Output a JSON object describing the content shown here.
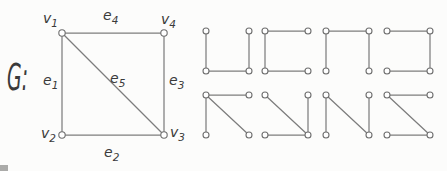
{
  "figure": {
    "width": 447,
    "height": 171,
    "background": "#fcfcfb",
    "line_color": "#7d7d7d",
    "text_color": "#3a3a3a",
    "vertex_fill": "#ffffff",
    "vertex_stroke": "#6f6f6f",
    "main_vertex_radius": 3.2,
    "small_vertex_radius": 3,
    "line_width": 1.25
  },
  "main_graph": {
    "name_label": "G:",
    "name_x": 7,
    "name_y": 90,
    "name_size": 38,
    "name_text_length": 21,
    "label_size": 14,
    "vertices": [
      {
        "id": "v1",
        "x": 62,
        "y": 33,
        "label": "v",
        "sub": "1",
        "lx": 43,
        "ly": 23
      },
      {
        "id": "v2",
        "x": 62,
        "y": 135,
        "label": "v",
        "sub": "2",
        "lx": 41,
        "ly": 138
      },
      {
        "id": "v3",
        "x": 164,
        "y": 135,
        "label": "v",
        "sub": "3",
        "lx": 170,
        "ly": 137
      },
      {
        "id": "v4",
        "x": 164,
        "y": 33,
        "label": "v",
        "sub": "4",
        "lx": 161,
        "ly": 24
      }
    ],
    "edges": [
      {
        "id": "e1",
        "from": "v1",
        "to": "v2",
        "label": "e",
        "sub": "1",
        "lx": 43,
        "ly": 85
      },
      {
        "id": "e2",
        "from": "v2",
        "to": "v3",
        "label": "e",
        "sub": "2",
        "lx": 104,
        "ly": 157
      },
      {
        "id": "e3",
        "from": "v4",
        "to": "v3",
        "label": "e",
        "sub": "3",
        "lx": 169,
        "ly": 85
      },
      {
        "id": "e4",
        "from": "v1",
        "to": "v4",
        "label": "e",
        "sub": "4",
        "lx": 103,
        "ly": 20
      },
      {
        "id": "e5",
        "from": "v1",
        "to": "v3",
        "label": "e",
        "sub": "5",
        "lx": 110,
        "ly": 83
      }
    ]
  },
  "subgraphs": {
    "columns_x": [
      206,
      265,
      326,
      387
    ],
    "rows_y": [
      31,
      95
    ],
    "cell_width": 43,
    "cell_height": 40,
    "items": [
      {
        "row": 0,
        "col": 0,
        "segments": [
          "left",
          "bottom",
          "right"
        ]
      },
      {
        "row": 0,
        "col": 1,
        "segments": [
          "top",
          "left",
          "bottom"
        ]
      },
      {
        "row": 0,
        "col": 2,
        "segments": [
          "left",
          "top",
          "right"
        ]
      },
      {
        "row": 0,
        "col": 3,
        "segments": [
          "top",
          "right",
          "bottom"
        ]
      },
      {
        "row": 1,
        "col": 0,
        "segments": [
          "top",
          "left",
          "diagonal"
        ]
      },
      {
        "row": 1,
        "col": 1,
        "segments": [
          "diagonal",
          "right",
          "bottom"
        ]
      },
      {
        "row": 1,
        "col": 2,
        "segments": [
          "left",
          "diagonal",
          "right"
        ]
      },
      {
        "row": 1,
        "col": 3,
        "segments": [
          "top",
          "diagonal",
          "bottom"
        ]
      }
    ]
  },
  "artifact": {
    "x": 0,
    "y": 165,
    "width": 8,
    "height": 6,
    "color": "#90908e"
  }
}
